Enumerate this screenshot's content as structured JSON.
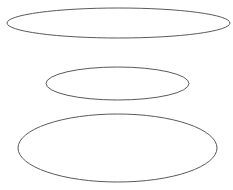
{
  "canvas": {
    "width": 233,
    "height": 190,
    "background": "#ffffff"
  },
  "stroke_color": "#5a5a5a",
  "ellipses": [
    {
      "name": "top",
      "cx": 118.5,
      "cy": 23,
      "rx": 111.5,
      "ry": 15
    },
    {
      "name": "middle",
      "cx": 117.5,
      "cy": 83.5,
      "rx": 71.5,
      "ry": 16.5
    },
    {
      "name": "bottom",
      "cx": 117.5,
      "cy": 148,
      "rx": 99.5,
      "ry": 34
    }
  ]
}
